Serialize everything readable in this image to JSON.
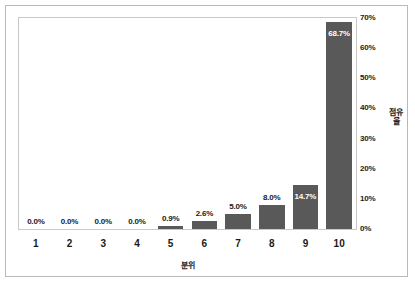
{
  "chart_data": {
    "type": "bar",
    "title": "",
    "subtitle": "",
    "xlabel": "분위",
    "ylabel": "점유율",
    "categories": [
      "1",
      "2",
      "3",
      "4",
      "5",
      "6",
      "7",
      "8",
      "9",
      "10"
    ],
    "values": [
      0.0,
      0.0,
      0.0,
      0.0,
      0.9,
      2.6,
      5.0,
      8.0,
      14.7,
      68.7
    ],
    "data_labels": [
      "0.0%",
      "0.0%",
      "0.0%",
      "0.0%",
      "0.9%",
      "2.6%",
      "5.0%",
      "8.0%",
      "14.7%",
      "68.7%"
    ],
    "ylim": [
      0,
      70
    ],
    "ytick_values": [
      0,
      10,
      20,
      30,
      40,
      50,
      60,
      70
    ],
    "ytick_labels": [
      "0%",
      "10%",
      "20%",
      "30%",
      "40%",
      "50%",
      "60%",
      "70%"
    ],
    "yaxis_position": "right",
    "grid": false,
    "legend": null,
    "bar_color": "#595959",
    "label_color": "#1a1a1a",
    "inside_label_color": "#ffffff",
    "plot_border_color": "#c9c9c9",
    "frame_border_color": "#b9b9b9",
    "background_color": "#ffffff"
  }
}
